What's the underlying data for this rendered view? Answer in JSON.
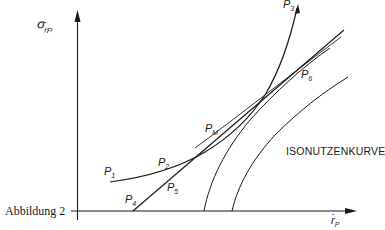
{
  "figure": {
    "caption": "Abbildung 2",
    "y_axis_label": "σ",
    "y_axis_sub": "rP",
    "x_axis_label": "r̄",
    "x_axis_sub": "P",
    "curve_label": "ISONUTZENKURVE"
  },
  "points": {
    "p1": {
      "main": "P",
      "sub": "1"
    },
    "p2": {
      "main": "P",
      "sub": "2"
    },
    "p3": {
      "main": "P",
      "sub": "3"
    },
    "p4": {
      "main": "P",
      "sub": "4"
    },
    "p5": {
      "main": "P",
      "sub": "5"
    },
    "p6": {
      "main": "P",
      "sub": "6"
    },
    "pm": {
      "main": "P",
      "sub": "M"
    }
  },
  "colors": {
    "ink": "#1a1a1a",
    "background": "#ffffff"
  }
}
